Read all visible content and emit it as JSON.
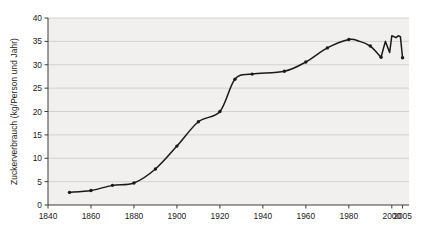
{
  "chart_data": {
    "type": "line",
    "title": "",
    "subtitle": "",
    "xlabel": "",
    "ylabel": "Zuckerverbrauch (kg/Person und Jahr)",
    "xlim": [
      1840,
      2008
    ],
    "ylim": [
      0,
      40
    ],
    "grid": true,
    "legend": null,
    "xticks": [
      1840,
      1860,
      1880,
      1900,
      1920,
      1940,
      1960,
      1980,
      2000,
      2005
    ],
    "xticklabels": [
      "1840",
      "1860",
      "1880",
      "1900",
      "1920",
      "1940",
      "1960",
      "1980",
      "2000",
      "2005"
    ],
    "yticks": [
      0,
      5,
      10,
      15,
      20,
      25,
      30,
      35,
      40
    ],
    "yticklabels": [
      "0",
      "5",
      "10",
      "15",
      "20",
      "25",
      "30",
      "35",
      "40"
    ],
    "series": [
      {
        "name": "Zuckerverbrauch",
        "marker": "dot",
        "color": "#1a1a1a",
        "x": [
          1850,
          1860,
          1870,
          1880,
          1890,
          1900,
          1910,
          1920,
          1927,
          1935,
          1950,
          1960,
          1970,
          1980,
          1985,
          1990,
          1995,
          1997,
          1999,
          2000,
          2002,
          2003,
          2004,
          2005
        ],
        "y": [
          2.7,
          3.1,
          4.2,
          4.7,
          7.7,
          12.6,
          17.8,
          20.0,
          26.9,
          28.0,
          28.6,
          30.6,
          33.6,
          35.4,
          35.0,
          34.0,
          31.6,
          35.0,
          32.6,
          36.2,
          35.8,
          36.2,
          36.0,
          31.5
        ],
        "marked_points": [
          1850,
          1860,
          1870,
          1880,
          1890,
          1900,
          1910,
          1920,
          1927,
          1935,
          1950,
          1960,
          1970,
          1980,
          1990,
          1995,
          2005
        ]
      }
    ]
  },
  "style": {
    "plot_background": "#f1f0ef",
    "grid_color": "#c9c9c9",
    "axis_color": "#3c3c3c",
    "line_color": "#1a1a1a",
    "text_color": "#1a1a1a",
    "page_background": "#ffffff"
  }
}
